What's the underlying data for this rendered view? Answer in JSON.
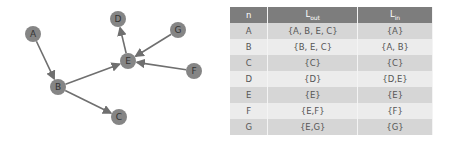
{
  "graph": {
    "nodes": [
      {
        "id": "A",
        "x": 33,
        "y": 34
      },
      {
        "id": "B",
        "x": 58,
        "y": 87
      },
      {
        "id": "C",
        "x": 119,
        "y": 117
      },
      {
        "id": "D",
        "x": 118,
        "y": 19
      },
      {
        "id": "E",
        "x": 128,
        "y": 61
      },
      {
        "id": "F",
        "x": 194,
        "y": 71
      },
      {
        "id": "G",
        "x": 178,
        "y": 30
      }
    ],
    "edges": [
      [
        "A",
        "B"
      ],
      [
        "B",
        "E"
      ],
      [
        "B",
        "C"
      ],
      [
        "E",
        "D"
      ],
      [
        "G",
        "E"
      ],
      [
        "F",
        "E"
      ]
    ],
    "node_color": "#858585",
    "edge_color": "#6f6f6f"
  },
  "table": {
    "headers": [
      {
        "main": "n",
        "sub": ""
      },
      {
        "main": "L",
        "sub": "out"
      },
      {
        "main": "L",
        "sub": "in"
      }
    ],
    "rows": [
      {
        "n": "A",
        "out": "{A, B, E, C}",
        "in": "{A}"
      },
      {
        "n": "B",
        "out": "{B, E, C}",
        "in": "{A, B}"
      },
      {
        "n": "C",
        "out": "{C}",
        "in": "{C}"
      },
      {
        "n": "D",
        "out": "{D}",
        "in": "{D,E}"
      },
      {
        "n": "E",
        "out": "{E}",
        "in": "{E}"
      },
      {
        "n": "F",
        "out": "{E,F}",
        "in": "{F}"
      },
      {
        "n": "G",
        "out": "{E,G}",
        "in": "{G}"
      }
    ]
  }
}
